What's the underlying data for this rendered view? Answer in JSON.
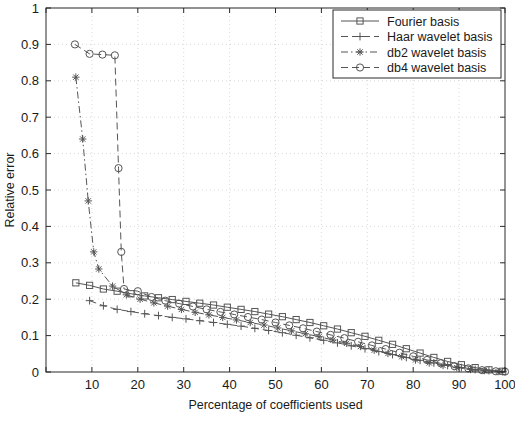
{
  "chart_data": {
    "type": "line",
    "title": "",
    "xlabel": "Percentage of coefficients used",
    "ylabel": "Relative error",
    "xlim": [
      0,
      100
    ],
    "ylim": [
      0,
      1
    ],
    "xticks": [
      0,
      10,
      20,
      30,
      40,
      50,
      60,
      70,
      80,
      90,
      100
    ],
    "xtick_labels": [
      "",
      "10",
      "20",
      "30",
      "40",
      "50",
      "60",
      "70",
      "80",
      "90",
      "100"
    ],
    "yticks": [
      0,
      0.1,
      0.2,
      0.3,
      0.4,
      0.5,
      0.6,
      0.7,
      0.8,
      0.9,
      1
    ],
    "ytick_labels": [
      "0",
      "0.1",
      "0.2",
      "0.3",
      "0.4",
      "0.5",
      "0.6",
      "0.7",
      "0.8",
      "0.9",
      "1"
    ],
    "grid": true,
    "legend_position": "top-right",
    "series": [
      {
        "name": "Fourier basis",
        "marker": "square",
        "linestyle": "solid",
        "color": "#555555",
        "points": [
          [
            6.5,
            0.245
          ],
          [
            9.5,
            0.238
          ],
          [
            12.5,
            0.228
          ],
          [
            15.5,
            0.222
          ],
          [
            18.5,
            0.215
          ],
          [
            21.5,
            0.209
          ],
          [
            24.5,
            0.204
          ],
          [
            27.5,
            0.199
          ],
          [
            30.5,
            0.194
          ],
          [
            33.5,
            0.189
          ],
          [
            36.5,
            0.184
          ],
          [
            39.5,
            0.178
          ],
          [
            42.5,
            0.172
          ],
          [
            45.5,
            0.166
          ],
          [
            48.5,
            0.159
          ],
          [
            51.5,
            0.152
          ],
          [
            54.5,
            0.144
          ],
          [
            57.5,
            0.136
          ],
          [
            60.5,
            0.127
          ],
          [
            63.5,
            0.118
          ],
          [
            66.5,
            0.108
          ],
          [
            69.5,
            0.098
          ],
          [
            72.5,
            0.087
          ],
          [
            75.5,
            0.076
          ],
          [
            78.5,
            0.064
          ],
          [
            81.5,
            0.052
          ],
          [
            84.5,
            0.04
          ],
          [
            87.5,
            0.029
          ],
          [
            90.5,
            0.02
          ],
          [
            93.5,
            0.012
          ],
          [
            96.5,
            0.006
          ],
          [
            99.5,
            0.002
          ]
        ]
      },
      {
        "name": "Haar wavelet basis",
        "marker": "plus",
        "linestyle": "dashed",
        "color": "#555555",
        "points": [
          [
            9.5,
            0.196
          ],
          [
            12.5,
            0.182
          ],
          [
            15.5,
            0.172
          ],
          [
            18.5,
            0.166
          ],
          [
            21.5,
            0.16
          ],
          [
            24.5,
            0.155
          ],
          [
            27.5,
            0.15
          ],
          [
            30.5,
            0.146
          ],
          [
            33.5,
            0.141
          ],
          [
            36.5,
            0.136
          ],
          [
            39.5,
            0.131
          ],
          [
            42.5,
            0.126
          ],
          [
            45.5,
            0.12
          ],
          [
            48.5,
            0.114
          ],
          [
            51.5,
            0.108
          ],
          [
            54.5,
            0.101
          ],
          [
            57.5,
            0.094
          ],
          [
            60.5,
            0.087
          ],
          [
            63.5,
            0.08
          ],
          [
            66.5,
            0.072
          ],
          [
            69.5,
            0.064
          ],
          [
            72.5,
            0.056
          ],
          [
            75.5,
            0.048
          ],
          [
            78.5,
            0.04
          ],
          [
            81.5,
            0.032
          ],
          [
            84.5,
            0.025
          ],
          [
            87.5,
            0.018
          ],
          [
            90.5,
            0.012
          ],
          [
            93.5,
            0.007
          ],
          [
            96.5,
            0.004
          ],
          [
            99.5,
            0.001
          ]
        ]
      },
      {
        "name": "db2 wavelet basis",
        "marker": "asterisk",
        "linestyle": "dashdot",
        "color": "#555555",
        "points": [
          [
            6.5,
            0.81
          ],
          [
            8.0,
            0.64
          ],
          [
            9.2,
            0.47
          ],
          [
            10.4,
            0.33
          ],
          [
            11.5,
            0.283
          ],
          [
            14.5,
            0.236
          ],
          [
            17.5,
            0.212
          ],
          [
            20.5,
            0.2
          ],
          [
            23.5,
            0.19
          ],
          [
            26.5,
            0.181
          ],
          [
            29.5,
            0.172
          ],
          [
            32.5,
            0.164
          ],
          [
            35.5,
            0.157
          ],
          [
            38.5,
            0.15
          ],
          [
            41.5,
            0.143
          ],
          [
            44.5,
            0.136
          ],
          [
            47.5,
            0.129
          ],
          [
            50.5,
            0.121
          ],
          [
            53.5,
            0.113
          ],
          [
            56.5,
            0.105
          ],
          [
            59.5,
            0.097
          ],
          [
            62.5,
            0.088
          ],
          [
            65.5,
            0.079
          ],
          [
            68.5,
            0.07
          ],
          [
            71.5,
            0.06
          ],
          [
            74.5,
            0.051
          ],
          [
            77.5,
            0.042
          ],
          [
            80.5,
            0.033
          ],
          [
            83.5,
            0.025
          ],
          [
            86.5,
            0.018
          ],
          [
            89.5,
            0.012
          ],
          [
            92.5,
            0.007
          ],
          [
            95.5,
            0.004
          ],
          [
            98.5,
            0.001
          ]
        ]
      },
      {
        "name": "db4 wavelet basis",
        "marker": "circle",
        "linestyle": "dashed",
        "color": "#555555",
        "points": [
          [
            6.3,
            0.9
          ],
          [
            9.5,
            0.874
          ],
          [
            12.3,
            0.872
          ],
          [
            15.0,
            0.87
          ],
          [
            15.8,
            0.56
          ],
          [
            16.4,
            0.33
          ],
          [
            17.0,
            0.228
          ],
          [
            20.0,
            0.222
          ],
          [
            23.0,
            0.206
          ],
          [
            26.0,
            0.196
          ],
          [
            29.0,
            0.188
          ],
          [
            32.0,
            0.18
          ],
          [
            35.0,
            0.172
          ],
          [
            38.0,
            0.165
          ],
          [
            41.0,
            0.158
          ],
          [
            44.0,
            0.151
          ],
          [
            47.0,
            0.144
          ],
          [
            50.0,
            0.136
          ],
          [
            53.0,
            0.128
          ],
          [
            56.0,
            0.12
          ],
          [
            59.0,
            0.111
          ],
          [
            62.0,
            0.102
          ],
          [
            65.0,
            0.093
          ],
          [
            68.0,
            0.083
          ],
          [
            71.0,
            0.073
          ],
          [
            74.0,
            0.063
          ],
          [
            77.0,
            0.053
          ],
          [
            80.0,
            0.043
          ],
          [
            83.0,
            0.033
          ],
          [
            86.0,
            0.024
          ],
          [
            89.0,
            0.016
          ],
          [
            92.0,
            0.01
          ],
          [
            95.0,
            0.005
          ],
          [
            98.0,
            0.002
          ],
          [
            100.0,
            0.001
          ]
        ]
      }
    ]
  }
}
